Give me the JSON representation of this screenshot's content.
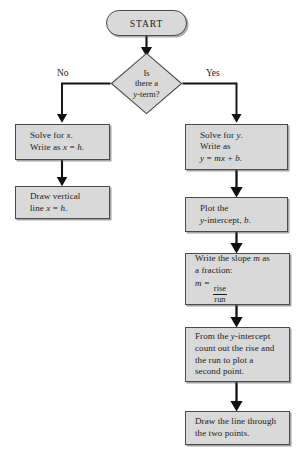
{
  "figure": {
    "type": "flowchart",
    "colors": {
      "node_fill": "#d9d9d9",
      "node_border": "#4a4a4a",
      "connector": "#111111",
      "background": "#ffffff",
      "text": "#1c1c1c"
    }
  },
  "nodes": {
    "start": {
      "shape": "terminator",
      "label": "START"
    },
    "decision": {
      "shape": "diamond",
      "line1": "Is",
      "line2": "there a",
      "line3_var": "y",
      "line3_rest": "-term?"
    },
    "left_box_1": {
      "shape": "process",
      "l1_a": "Solve for ",
      "l1_var": "x",
      "l1_b": ".",
      "l2_a": "Write as ",
      "l2_var": "x",
      "l2_eq": "=",
      "l2_var2": "h",
      "l2_b": "."
    },
    "left_box_2": {
      "shape": "process",
      "l1": "Draw vertical",
      "l2_a": "line ",
      "l2_var": "x",
      "l2_eq": "=",
      "l2_var2": "h",
      "l2_b": "."
    },
    "right_box_1": {
      "shape": "process",
      "l1_a": "Solve for ",
      "l1_var": "y",
      "l1_b": ".",
      "l2": "Write as",
      "l3_var": "y",
      "l3_eq": "=",
      "l3_mx": "mx",
      "l3_plus": "+",
      "l3_b": "b",
      "l3_end": "."
    },
    "right_box_2": {
      "shape": "process",
      "l1": "Plot the",
      "l2_var": "y",
      "l2_a": "-intercept, ",
      "l2_var2": "b",
      "l2_b": "."
    },
    "right_box_3": {
      "shape": "process",
      "l1_a": "Write the slope ",
      "l1_var": "m",
      "l1_b": " as",
      "l2": "a fraction:",
      "l3_var": "m",
      "l3_eq": "=",
      "l3_num": "rise",
      "l3_den": "run"
    },
    "right_box_4": {
      "shape": "process",
      "l1_a": "From the ",
      "l1_var": "y",
      "l1_b": "-intercept",
      "l2": "count out the rise and",
      "l3": "the run to plot a",
      "l4": "second point."
    },
    "right_box_5": {
      "shape": "process",
      "l1": "Draw the line through",
      "l2": "the two points."
    }
  },
  "branch_labels": {
    "no": "No",
    "yes": "Yes"
  }
}
